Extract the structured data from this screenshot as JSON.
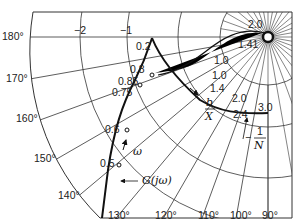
{
  "diagram": {
    "type": "describing-function-polar-plot",
    "center": {
      "x": 268,
      "y": 37
    },
    "colors": {
      "grid": "#333333",
      "curve": "#111111",
      "background": "#ffffff"
    },
    "angle_labels": [
      {
        "text": "180°",
        "deg": 180
      },
      {
        "text": "170°",
        "deg": 170
      },
      {
        "text": "160°",
        "deg": 160
      },
      {
        "text": "150°",
        "deg": 150
      },
      {
        "text": "140°",
        "deg": 140
      },
      {
        "text": "130°",
        "deg": 130
      },
      {
        "text": "120°",
        "deg": 120
      },
      {
        "text": "110°",
        "deg": 110
      },
      {
        "text": "100°",
        "deg": 100
      },
      {
        "text": "90°",
        "deg": 90
      }
    ],
    "magnitude_labels": [
      {
        "text": "−2"
      },
      {
        "text": "−1"
      }
    ],
    "g_curve": {
      "label": "G(jω)",
      "direction_label": "ω",
      "points": [
        {
          "text": "0.2"
        },
        {
          "text": "0.5"
        },
        {
          "text": "0.6"
        },
        {
          "text": "0.75"
        },
        {
          "text": "0.8"
        },
        {
          "text": "0.85"
        }
      ]
    },
    "n_curve": {
      "label_num": "1",
      "label_den": "N",
      "label_sign": "−",
      "param_num": "b",
      "param_den": "X",
      "points": [
        {
          "text": "2.0"
        },
        {
          "text": "1.41"
        },
        {
          "text": "1.0"
        },
        {
          "text": "1.0"
        },
        {
          "text": "1.4"
        },
        {
          "text": "2.0"
        },
        {
          "text": "2.4"
        },
        {
          "text": "3.0"
        }
      ]
    }
  }
}
